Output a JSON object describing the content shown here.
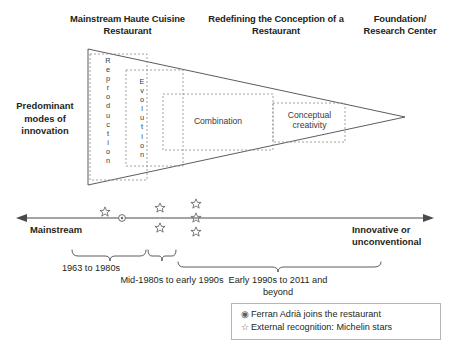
{
  "headers": {
    "mainstream": "Mainstream Haute Cuisine Restaurant",
    "redefining": "Redefining the Conception of a Restaurant",
    "foundation": "Foundation/ Research Center"
  },
  "left_label": "Predominant modes of innovation",
  "triangle_boxes": {
    "reproduction": "Reproduction",
    "evolution": "Evolution",
    "combination": "Combination",
    "conceptual": "Conceptual creativity"
  },
  "axis": {
    "left_label": "Mainstream",
    "right_label": "Innovative or unconventional"
  },
  "periods": [
    "1963 to 1980s",
    "Mid-1980s to early 1990s",
    "Early 1990s to 2011 and beyond"
  ],
  "legend": [
    {
      "glyph": "circle-marker",
      "symbol": "◉",
      "text": "Ferran Adrià joins the restaurant"
    },
    {
      "glyph": "star-marker",
      "symbol": "☆",
      "text": "External recognition: Michelin stars"
    }
  ],
  "colors": {
    "ink": "#231f20",
    "line": "#4a4a4a",
    "dashed": "#8a8a8a",
    "marker": "#6b6b6b",
    "legend_border": "#b6b6b6"
  },
  "markers": {
    "note": "positions along the timeline axis",
    "items": [
      {
        "type": "star",
        "x": 105,
        "row": "on-axis"
      },
      {
        "type": "circle",
        "x": 122,
        "row": "on-axis"
      },
      {
        "type": "star",
        "x": 160,
        "row": "above"
      },
      {
        "type": "star",
        "x": 160,
        "row": "below"
      },
      {
        "type": "star",
        "x": 196,
        "row": "above"
      },
      {
        "type": "star",
        "x": 196,
        "row": "on-axis"
      },
      {
        "type": "star",
        "x": 196,
        "row": "below"
      }
    ]
  }
}
